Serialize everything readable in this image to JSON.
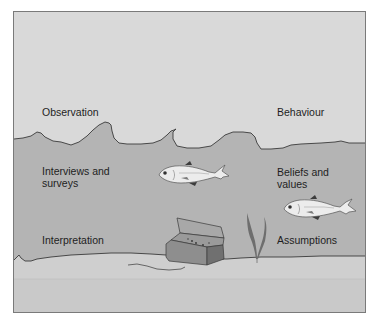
{
  "diagram": {
    "type": "ocean-layers-metaphor",
    "colors": {
      "surface": "#d9d9d9",
      "water": "#b4b4b4",
      "seabed": "#cfcfcf",
      "seabed_lower": "#c8c8c8",
      "outline": "#3a3a3a",
      "frame_border": "#7a7a7a",
      "text": "#1e1e1e"
    },
    "layers": [
      {
        "name": "surface",
        "left_label": "Observation",
        "right_label": "Behaviour"
      },
      {
        "name": "water",
        "left_label": "Interviews and surveys",
        "left_label_lines": [
          "Interviews and",
          "surveys"
        ],
        "right_label": "Beliefs and values",
        "right_label_lines": [
          "Beliefs and",
          "values"
        ]
      },
      {
        "name": "seabed",
        "left_label": "Interpretation",
        "right_label": "Assumptions"
      }
    ],
    "illustrations": [
      {
        "name": "fish",
        "position": "center-upper"
      },
      {
        "name": "fish",
        "position": "right-middle"
      },
      {
        "name": "treasure-chest",
        "position": "seabed-center"
      },
      {
        "name": "seaweed",
        "position": "seabed-center-right"
      }
    ]
  }
}
